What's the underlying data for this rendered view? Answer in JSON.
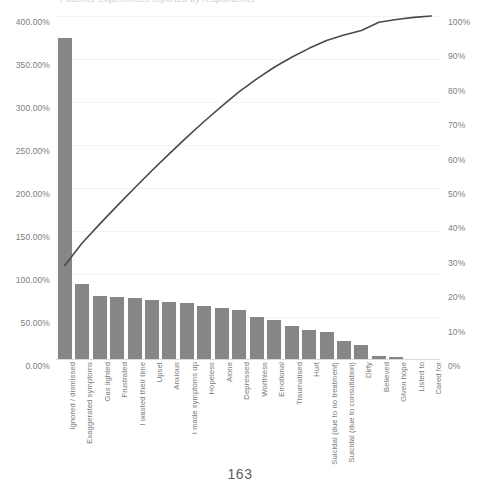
{
  "document": {
    "page_number": "163",
    "cropped_title": "Patients' experiences reported by respondents"
  },
  "chart_data": {
    "type": "bar",
    "title": "",
    "xlabel": "",
    "ylabel": "",
    "grid": true,
    "legend": false,
    "categories": [
      "Ignored / dismissed",
      "Exaggerated symptoms",
      "Gas lighted",
      "Frustrated",
      "I wasted their time",
      "Upset",
      "Anxious",
      "I made symptoms up",
      "Hopeless",
      "Alone",
      "Depressed",
      "Worthless",
      "Emotional",
      "Traumatised",
      "Hurt",
      "Suicidal (due to no treatment)",
      "Suicidal (due to consultation)",
      "Dirty",
      "Believed",
      "Given hope",
      "Listed to",
      "Cared for"
    ],
    "series": [
      {
        "name": "Frequency",
        "axis": "left",
        "unit": "%",
        "values": [
          375.0,
          88.0,
          75.0,
          73.0,
          72.0,
          70.0,
          67.0,
          66.0,
          63.0,
          61.0,
          58.0,
          50.0,
          47.0,
          40.0,
          35.0,
          32.0,
          22.0,
          18.0,
          5.0,
          3.0,
          1.5,
          0.5
        ]
      },
      {
        "name": "Cumulative %",
        "axis": "right",
        "unit": "%",
        "values": [
          27.5,
          34.0,
          39.5,
          44.8,
          50.0,
          55.1,
          60.0,
          64.8,
          69.4,
          73.8,
          78.0,
          81.7,
          85.1,
          88.0,
          90.6,
          92.9,
          94.5,
          95.8,
          98.2,
          99.0,
          99.6,
          100.0
        ]
      }
    ],
    "left_axis": {
      "label": "",
      "min": 0,
      "max": 400,
      "step": 50,
      "ticks": [
        "0.00%",
        "50.00%",
        "100.00%",
        "150.00%",
        "200.00%",
        "250.00%",
        "300.00%",
        "350.00%",
        "400.00%"
      ]
    },
    "right_axis": {
      "label": "",
      "min": 0,
      "max": 100,
      "step": 10,
      "ticks": [
        "0%",
        "10%",
        "20%",
        "30%",
        "40%",
        "50%",
        "60%",
        "70%",
        "80%",
        "90%",
        "100%"
      ]
    },
    "colors": {
      "bar": "#868686",
      "line": "#4a4a4a",
      "grid": "#f2f2f4",
      "axis_text": "#7d7d82"
    }
  }
}
